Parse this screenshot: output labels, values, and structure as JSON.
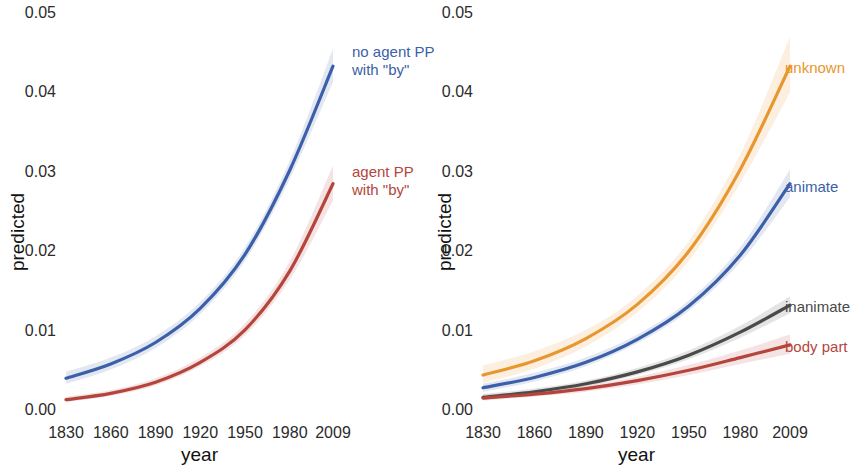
{
  "figure": {
    "width": 855,
    "height": 468,
    "background": "#ffffff"
  },
  "axis": {
    "ylabel": "predicted",
    "xlabel": "year",
    "yticks": [
      "0.00",
      "0.01",
      "0.02",
      "0.03",
      "0.04",
      "0.05"
    ],
    "ytick_values": [
      0.0,
      0.01,
      0.02,
      0.03,
      0.04,
      0.05
    ],
    "xticks": [
      "1830",
      "1860",
      "1890",
      "1920",
      "1950",
      "1980",
      "2009"
    ],
    "xtick_values": [
      1830,
      1860,
      1890,
      1920,
      1950,
      1980,
      2009
    ]
  },
  "colors": {
    "blue": "#3b5fa8",
    "red": "#b5453c",
    "orange": "#e8962e",
    "gray": "#4a4a4a",
    "tick_text": "#2b2b2b",
    "label_text": "#111111"
  },
  "panels": {
    "left": {
      "name": "left-panel",
      "annotations": [
        {
          "text_line1": "no agent PP",
          "text_line2": "with \"by\"",
          "color": "#3b5fa8"
        },
        {
          "text_line1": "agent PP",
          "text_line2": "with \"by\"",
          "color": "#b5453c"
        }
      ]
    },
    "right": {
      "name": "right-panel",
      "annotations": [
        {
          "text_line1": "unknown",
          "text_line2": "",
          "color": "#e8962e"
        },
        {
          "text_line1": "animate",
          "text_line2": "",
          "color": "#3b5fa8"
        },
        {
          "text_line1": "inanimate",
          "text_line2": "",
          "color": "#4a4a4a"
        },
        {
          "text_line1": "body part",
          "text_line2": "",
          "color": "#b5453c"
        }
      ]
    }
  },
  "chart_data": [
    {
      "type": "line",
      "panel": "left",
      "title": "",
      "xlabel": "year",
      "ylabel": "predicted",
      "xlim": [
        1830,
        2009
      ],
      "ylim": [
        0.0,
        0.05
      ],
      "grid": false,
      "legend": "inline-annotations-right",
      "x": [
        1830,
        1860,
        1890,
        1920,
        1950,
        1980,
        2009
      ],
      "series": [
        {
          "name": "no agent PP with \"by\"",
          "color": "#3b5fa8",
          "values": [
            0.004,
            0.0058,
            0.0085,
            0.0128,
            0.0196,
            0.0302,
            0.0433
          ],
          "band_low": [
            0.0033,
            0.0051,
            0.0078,
            0.0121,
            0.0188,
            0.0291,
            0.0413
          ],
          "band_high": [
            0.0048,
            0.0066,
            0.0093,
            0.0136,
            0.0205,
            0.0314,
            0.0455
          ]
        },
        {
          "name": "agent PP with \"by\"",
          "color": "#b5453c",
          "values": [
            0.0013,
            0.0021,
            0.0035,
            0.006,
            0.0101,
            0.0175,
            0.0285
          ],
          "band_low": [
            0.001,
            0.0018,
            0.0031,
            0.0055,
            0.0094,
            0.0164,
            0.0264
          ],
          "band_high": [
            0.0017,
            0.0025,
            0.004,
            0.0066,
            0.0109,
            0.0187,
            0.0308
          ]
        }
      ]
    },
    {
      "type": "line",
      "panel": "right",
      "title": "",
      "xlabel": "year",
      "ylabel": "predicted",
      "xlim": [
        1830,
        2009
      ],
      "ylim": [
        0.0,
        0.05
      ],
      "grid": false,
      "legend": "inline-annotations-right",
      "x": [
        1830,
        1860,
        1890,
        1920,
        1950,
        1980,
        2009
      ],
      "series": [
        {
          "name": "unknown",
          "color": "#e8962e",
          "values": [
            0.0044,
            0.0062,
            0.009,
            0.0133,
            0.02,
            0.0303,
            0.0433
          ],
          "band_low": [
            0.0034,
            0.0052,
            0.008,
            0.0123,
            0.0188,
            0.0286,
            0.04
          ],
          "band_high": [
            0.0056,
            0.0074,
            0.0101,
            0.0144,
            0.0213,
            0.0322,
            0.047
          ]
        },
        {
          "name": "animate",
          "color": "#3b5fa8",
          "values": [
            0.0028,
            0.0041,
            0.006,
            0.0089,
            0.0131,
            0.0195,
            0.0285
          ],
          "band_low": [
            0.0023,
            0.0036,
            0.0055,
            0.0084,
            0.0125,
            0.0186,
            0.0268
          ],
          "band_high": [
            0.0033,
            0.0047,
            0.0066,
            0.0095,
            0.0138,
            0.0205,
            0.0303
          ]
        },
        {
          "name": "inanimate",
          "color": "#4a4a4a",
          "values": [
            0.0016,
            0.0023,
            0.0033,
            0.0048,
            0.0069,
            0.0098,
            0.0132
          ],
          "band_low": [
            0.0013,
            0.002,
            0.003,
            0.0044,
            0.0064,
            0.0091,
            0.0122
          ],
          "band_high": [
            0.002,
            0.0027,
            0.0037,
            0.0053,
            0.0075,
            0.0106,
            0.0143
          ]
        },
        {
          "name": "body part",
          "color": "#b5453c",
          "values": [
            0.0015,
            0.002,
            0.0027,
            0.0037,
            0.005,
            0.0066,
            0.0082
          ],
          "band_low": [
            0.0012,
            0.0017,
            0.0023,
            0.0032,
            0.0044,
            0.0058,
            0.0071
          ],
          "band_high": [
            0.0019,
            0.0024,
            0.0031,
            0.0042,
            0.0057,
            0.0075,
            0.0095
          ]
        }
      ]
    }
  ]
}
